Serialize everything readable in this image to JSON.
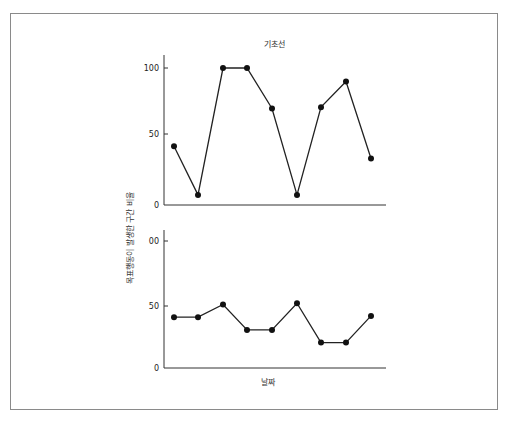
{
  "chart_data": [
    {
      "type": "line",
      "title": "기초선",
      "xlabel": "",
      "ylabel": "목표행동이 발생한 구간 비율",
      "ylim": [
        0,
        100
      ],
      "yticks": [
        "0",
        "50",
        "100"
      ],
      "x": [
        1,
        2,
        3,
        4,
        5,
        6,
        7,
        8,
        9
      ],
      "values": [
        42,
        6,
        100,
        100,
        70,
        6,
        71,
        90,
        33
      ],
      "grid": false
    },
    {
      "type": "line",
      "title": "",
      "xlabel": "날짜",
      "ylabel": "목표행동이 발생한 구간 비율",
      "ylim": [
        0,
        100
      ],
      "yticks": [
        "0",
        "50",
        "00"
      ],
      "x": [
        1,
        2,
        3,
        4,
        5,
        6,
        7,
        8,
        9
      ],
      "values": [
        40,
        40,
        50,
        30,
        30,
        51,
        20,
        20,
        41
      ],
      "grid": false
    }
  ],
  "labels": {
    "top_title": "기초선",
    "y_axis": "목표행동이 발생한 구간 비율",
    "x_axis": "날짜",
    "top_ticks": [
      "100",
      "50",
      "0"
    ],
    "bottom_ticks": [
      "00",
      "50",
      "0"
    ]
  }
}
